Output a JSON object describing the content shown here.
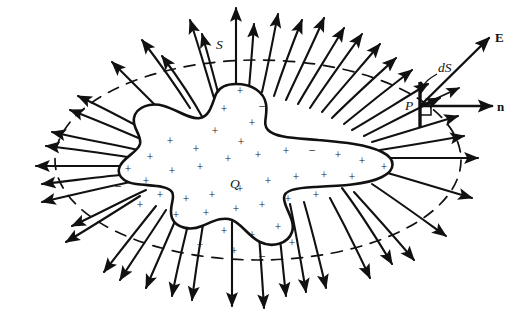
{
  "figure": {
    "type": "physics-diagram",
    "background_color": "#ffffff",
    "ink_color": "#111111",
    "width": 516,
    "height": 319
  },
  "labels": {
    "gaussian_surface": "S",
    "enclosed_charge": "Q",
    "area_element": "dS",
    "point": "P",
    "field_vector": "E",
    "normal_vector": "n"
  },
  "charge_signs": {
    "positive": "+",
    "negative": "–",
    "positive_count": 38,
    "negative_count": 5
  },
  "elements": {
    "charged_body": {
      "name": "irregular charged conductor",
      "fill": "#ffffff",
      "stroke": "#111111",
      "description": "amoeba / star shaped blob at center filled with plus and minus signs"
    },
    "gaussian_surface": {
      "name": "closed surface S",
      "style": "dashed ellipse",
      "stroke": "#111111",
      "dash": "11 9"
    },
    "field_lines": {
      "name": "electric field lines",
      "count": 44,
      "style": "solid curves with arrowheads pointing outward",
      "stroke": "#111111"
    },
    "detail_at_P": {
      "area_element_orientation": "short vertical segment",
      "normal_direction": "horizontal, to the right",
      "field_direction": "up and to the right",
      "right_angle_marked": true
    }
  },
  "charge_positions": [
    {
      "x": 240,
      "y": 92,
      "s": "+"
    },
    {
      "x": 262,
      "y": 106,
      "s": "–"
    },
    {
      "x": 224,
      "y": 110,
      "s": "+"
    },
    {
      "x": 252,
      "y": 124,
      "s": "+"
    },
    {
      "x": 215,
      "y": 132,
      "s": "+"
    },
    {
      "x": 241,
      "y": 143,
      "s": "+"
    },
    {
      "x": 196,
      "y": 150,
      "s": "+"
    },
    {
      "x": 170,
      "y": 142,
      "s": "+"
    },
    {
      "x": 150,
      "y": 158,
      "s": "+"
    },
    {
      "x": 128,
      "y": 170,
      "s": "+"
    },
    {
      "x": 118,
      "y": 186,
      "s": "–"
    },
    {
      "x": 146,
      "y": 182,
      "s": "+"
    },
    {
      "x": 172,
      "y": 172,
      "s": "+"
    },
    {
      "x": 200,
      "y": 168,
      "s": "+"
    },
    {
      "x": 228,
      "y": 160,
      "s": "+"
    },
    {
      "x": 258,
      "y": 156,
      "s": "+"
    },
    {
      "x": 286,
      "y": 152,
      "s": "+"
    },
    {
      "x": 312,
      "y": 150,
      "s": "–"
    },
    {
      "x": 338,
      "y": 156,
      "s": "+"
    },
    {
      "x": 362,
      "y": 162,
      "s": "+"
    },
    {
      "x": 384,
      "y": 168,
      "s": "+"
    },
    {
      "x": 352,
      "y": 178,
      "s": "+"
    },
    {
      "x": 324,
      "y": 176,
      "s": "+"
    },
    {
      "x": 296,
      "y": 178,
      "s": "+"
    },
    {
      "x": 268,
      "y": 182,
      "s": "+"
    },
    {
      "x": 240,
      "y": 190,
      "s": "+"
    },
    {
      "x": 212,
      "y": 196,
      "s": "+"
    },
    {
      "x": 186,
      "y": 200,
      "s": "+"
    },
    {
      "x": 160,
      "y": 196,
      "s": "+"
    },
    {
      "x": 140,
      "y": 206,
      "s": "+"
    },
    {
      "x": 176,
      "y": 216,
      "s": "+"
    },
    {
      "x": 206,
      "y": 214,
      "s": "+"
    },
    {
      "x": 236,
      "y": 210,
      "s": "+"
    },
    {
      "x": 262,
      "y": 206,
      "s": "+"
    },
    {
      "x": 288,
      "y": 200,
      "s": "+"
    },
    {
      "x": 224,
      "y": 232,
      "s": "+"
    },
    {
      "x": 252,
      "y": 236,
      "s": "+"
    },
    {
      "x": 278,
      "y": 228,
      "s": "+"
    },
    {
      "x": 200,
      "y": 246,
      "s": "+"
    },
    {
      "x": 234,
      "y": 252,
      "s": "+"
    },
    {
      "x": 262,
      "y": 256,
      "s": "–"
    },
    {
      "x": 292,
      "y": 244,
      "s": "+"
    },
    {
      "x": 316,
      "y": 196,
      "s": "+"
    }
  ],
  "field_lines_paths": [
    "M236 96 C236 70 236 44 236 8",
    "M262 92 C268 66 272 44 278 14",
    "M214 98 C206 72 200 50 190 20",
    "M286 100 C298 74 310 50 324 18",
    "M190 108 C176 86 162 66 142 40",
    "M310 108 C326 84 342 62 362 34",
    "M170 120 C152 102 134 84 112 62",
    "M332 118 C352 98 372 80 396 58",
    "M152 134 C130 122 108 110 78 96",
    "M352 130 C376 116 398 102 428 84",
    "M138 150 C112 144 86 140 52 132",
    "M372 142 C398 134 424 126 458 116",
    "M128 166 C100 166 72 166 36 166",
    "M386 158 C414 158 442 158 478 158",
    "M130 182 C102 188 76 194 42 202",
    "M384 172 C412 180 438 188 472 198",
    "M140 196 C118 210 96 224 66 242",
    "M372 184 C396 200 418 216 446 236",
    "M156 206 C140 226 124 246 104 272",
    "M354 192 C374 214 392 234 414 260",
    "M178 214 C168 238 158 260 146 288",
    "M330 198 C344 224 356 248 370 278",
    "M204 218 C200 244 196 268 192 300",
    "M304 202 C312 230 318 254 326 288",
    "M232 222 C232 248 232 272 232 306",
    "M276 206 C280 234 282 260 286 296",
    "M258 222 C260 248 262 274 264 308",
    "M204 120 C192 98 180 80 162 56",
    "M222 108 C216 84 210 62 202 34",
    "M248 100 C250 76 252 54 254 24",
    "M274 96 C282 72 290 50 302 20",
    "M298 104 C312 80 326 58 344 28",
    "M322 112 C340 90 358 70 380 44",
    "M344 124 C366 106 386 90 412 70",
    "M364 136 C388 124 410 112 440 98",
    "M380 150 C406 146 430 142 464 136",
    "M148 142 C124 132 102 122 70 110",
    "M134 158 C108 154 82 150 46 146",
    "M132 174 C104 176 78 180 42 184",
    "M146 190 C124 200 102 212 72 226",
    "M166 210 C152 232 138 252 120 280",
    "M190 216 C184 242 178 264 172 296",
    "M290 204 C296 232 300 256 306 292",
    "M342 188 C360 212 374 234 392 264"
  ]
}
